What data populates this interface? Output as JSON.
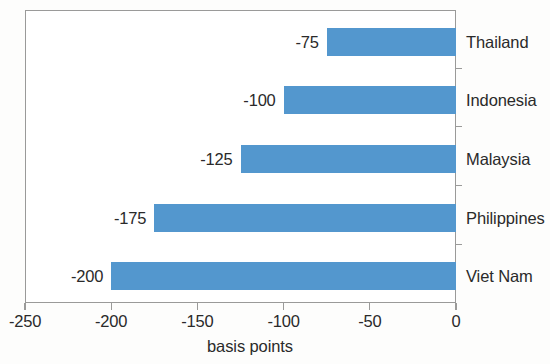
{
  "chart_data": {
    "type": "bar",
    "orientation": "horizontal",
    "title": "",
    "subtitle": "",
    "xlabel": "basis points",
    "ylabel": "",
    "xlim": [
      -250,
      0
    ],
    "grid": false,
    "legend": null,
    "bar_color": "#5397CE",
    "categories": [
      "Thailand",
      "Indonesia",
      "Malaysia",
      "Philippines",
      "Viet Nam"
    ],
    "values": [
      -75,
      -100,
      -125,
      -175,
      -200
    ],
    "data_labels": [
      "-75",
      "-100",
      "-125",
      "-175",
      "-200"
    ],
    "xticks": [
      -250,
      -200,
      -150,
      -100,
      -50,
      0
    ],
    "xtick_labels": [
      "-250",
      "-200",
      "-150",
      "-100",
      "-50",
      "0"
    ]
  }
}
